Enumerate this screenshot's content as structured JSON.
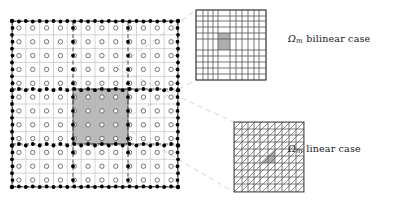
{
  "figure": {
    "title": "",
    "width": 418,
    "height": 205,
    "background": "#ffffff"
  },
  "colors": {
    "line_dark": "#1a1a1a",
    "line_mid": "#555555",
    "line_light": "#b9b9b9",
    "shade_fill": "#a6a6a6",
    "shade_fill_inset": "#a0a0a0",
    "connector": "#cccccc",
    "marker_open_stroke": "#3d3d3d",
    "marker_filled": "#000000",
    "text": "#1a1a1a"
  },
  "labels": {
    "bilinear": {
      "symbol": "Ω",
      "accent": "~",
      "subscript": "m",
      "text": "bilinear case",
      "full": "Ω̃m bilinear case"
    },
    "linear": {
      "symbol": "Ω",
      "accent": "~",
      "subscript": "m",
      "text": "linear case",
      "full": "Ω̃m linear case"
    }
  },
  "main_grid": {
    "name": "background-fine-grid-with-overlay-coarse-grid",
    "box": {
      "x": 12,
      "y": 21,
      "w": 166,
      "h": 166
    },
    "fine_divisions": 12,
    "coarse_divisions": 3,
    "marker_open": {
      "shape": "circle",
      "r": 2.2,
      "count_per_row": 12
    },
    "marker_filled": {
      "shape": "circle",
      "r": 1.9
    },
    "shaded_cell": {
      "x": 61,
      "y": 68,
      "w": 55,
      "h": 55,
      "label": "patch-omega-m"
    },
    "outer_border_dashed": true
  },
  "inset_bilinear": {
    "name": "inset-bilinear-quadrilateral-mesh",
    "box": {
      "x": 196,
      "y": 10,
      "w": 70,
      "h": 70
    },
    "mesh_type": "quadrilateral",
    "vlines": [
      0,
      7,
      12,
      17,
      22,
      34,
      40,
      46,
      52,
      58,
      63,
      70
    ],
    "hlines": [
      0,
      6,
      11,
      17,
      23,
      29,
      40,
      46,
      52,
      58,
      64,
      70
    ],
    "shaded_cell": {
      "x": 22,
      "y": 23,
      "w": 12,
      "h": 17
    }
  },
  "inset_linear": {
    "name": "inset-linear-triangular-mesh",
    "box": {
      "x": 234,
      "y": 122,
      "w": 70,
      "h": 70
    },
    "mesh_type": "triangular",
    "vlines": [
      0,
      8,
      14,
      20,
      26,
      34,
      41,
      48,
      55,
      62,
      70
    ],
    "hlines": [
      0,
      7,
      13,
      20,
      27,
      34,
      41,
      48,
      55,
      62,
      70
    ],
    "diagonal_direction": "up-right",
    "shaded_triangle": {
      "x": 26,
      "y": 27,
      "w": 15,
      "h": 14
    }
  },
  "connectors": {
    "name": "zoom-connector-dashed-lines",
    "style": "dashed",
    "to_bilinear": [
      {
        "x1": 116,
        "y1": 68,
        "x2": 196,
        "y2": 10
      },
      {
        "x1": 116,
        "y1": 123,
        "x2": 196,
        "y2": 80
      }
    ],
    "to_linear": [
      {
        "x1": 116,
        "y1": 68,
        "x2": 234,
        "y2": 122
      },
      {
        "x1": 116,
        "y1": 123,
        "x2": 234,
        "y2": 192
      }
    ]
  }
}
